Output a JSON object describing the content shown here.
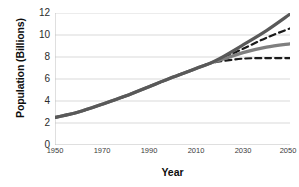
{
  "chart_data": {
    "type": "line",
    "title": "",
    "xlabel": "Year",
    "ylabel": "Population (Billions)",
    "xlim": [
      1950,
      2050
    ],
    "ylim": [
      0,
      12
    ],
    "xticks": [
      1950,
      1970,
      1990,
      2010,
      2030,
      2050
    ],
    "yticks": [
      0,
      2,
      4,
      6,
      8,
      10,
      12
    ],
    "grid": true,
    "legend": "none",
    "x": [
      1950,
      1960,
      1970,
      1980,
      1990,
      2000,
      2010,
      2015,
      2020,
      2030,
      2040,
      2050
    ],
    "series": [
      {
        "name": "high-variant-solid",
        "style": "solid",
        "color": "#595959",
        "values": [
          2.5,
          3.0,
          3.7,
          4.45,
          5.3,
          6.15,
          6.95,
          7.35,
          7.85,
          9.1,
          10.4,
          11.9
        ]
      },
      {
        "name": "high-variant-dashed",
        "style": "dashed",
        "color": "#1a1a1a",
        "values": [
          2.5,
          3.0,
          3.7,
          4.45,
          5.3,
          6.15,
          6.95,
          7.35,
          7.75,
          8.75,
          9.75,
          10.6
        ]
      },
      {
        "name": "medium-variant-solid",
        "style": "solid",
        "color": "#7f7f7f",
        "values": [
          2.5,
          3.0,
          3.7,
          4.45,
          5.3,
          6.15,
          6.95,
          7.35,
          7.7,
          8.4,
          8.9,
          9.2
        ]
      },
      {
        "name": "low-variant-dashed",
        "style": "dashed",
        "color": "#1a1a1a",
        "values": [
          2.5,
          3.0,
          3.7,
          4.45,
          5.3,
          6.15,
          6.95,
          7.35,
          7.6,
          7.85,
          7.9,
          7.9
        ]
      }
    ]
  },
  "axes": {
    "y_title": "Population (Billions)",
    "x_title": "Year",
    "y_tick_labels": [
      "12",
      "10",
      "8",
      "6",
      "4",
      "2",
      "0"
    ],
    "x_tick_labels": [
      "1950",
      "1970",
      "1990",
      "2010",
      "2030",
      "2050"
    ]
  },
  "colors": {
    "grid": "#d9d9d9",
    "axis": "#bfbfbf",
    "dark_gray_line": "#595959",
    "mid_gray_line": "#7f7f7f",
    "dashed_line": "#1a1a1a",
    "text": "#0d0d0d",
    "background": "#ffffff"
  }
}
